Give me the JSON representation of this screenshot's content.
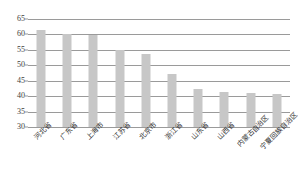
{
  "chart_data": {
    "type": "bar",
    "title": "",
    "xlabel": "",
    "ylabel": "",
    "ylim": [
      30,
      65
    ],
    "yticks": [
      30,
      35,
      40,
      45,
      50,
      55,
      60,
      65
    ],
    "grid": true,
    "legend": false,
    "bar_color": "#c7c7c7",
    "gridline_color": "#9a9a9a",
    "background_color": "#ffffff",
    "categories": [
      "河北省",
      "广东省",
      "上海市",
      "江苏省",
      "北京市",
      "浙江省",
      "山东省",
      "山西省",
      "内蒙古自治区",
      "宁夏回族自治区"
    ],
    "values": [
      61.3,
      60.2,
      59.8,
      55.0,
      53.8,
      47.2,
      42.2,
      41.3,
      41.0,
      40.8
    ],
    "series": [
      {
        "name": "",
        "values": [
          61.3,
          60.2,
          59.8,
          55.0,
          53.8,
          47.2,
          42.2,
          41.3,
          41.0,
          40.8
        ]
      }
    ]
  }
}
